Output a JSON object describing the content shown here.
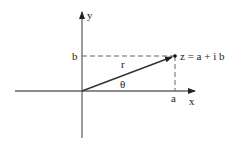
{
  "diagram": {
    "axes": {
      "x_label": "x",
      "y_label": "y"
    },
    "point": {
      "label": "z = a + i b",
      "real_label": "a",
      "imag_label": "b"
    },
    "vector": {
      "magnitude_label": "r",
      "angle_label": "θ"
    },
    "colors": {
      "line": "#555555",
      "arrow": "#222222",
      "background": "#ffffff"
    }
  }
}
